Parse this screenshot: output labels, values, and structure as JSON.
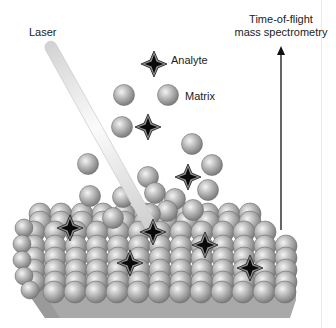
{
  "figure": {
    "labels": {
      "laser": "Laser",
      "analyte": "Analyte",
      "matrix": "Matrix",
      "tof_line1": "Time-of-flight",
      "tof_line2": "mass spectrometry"
    },
    "colors": {
      "sphere_light": "#e6e6e6",
      "sphere_mid": "#b4b4b4",
      "sphere_dark": "#7a7a7a",
      "analyte_halo": "#8f8f8f",
      "analyte_core": "#0a0a0a",
      "laser_light": "#f6f6f6",
      "laser_dark": "#cfcfcf",
      "base": "#a8a8a8",
      "arrow": "#111111"
    },
    "laser": {
      "x1": 48,
      "y1": 42,
      "x2": 154,
      "y2": 232,
      "width": 12
    },
    "arrow": {
      "x": 281,
      "y_top": 46,
      "y_bottom": 230
    },
    "free_matrix": [
      [
        124,
        95
      ],
      [
        168,
        95
      ],
      [
        122,
        127
      ],
      [
        192,
        144
      ],
      [
        88,
        164
      ],
      [
        148,
        177
      ],
      [
        123,
        197
      ],
      [
        155,
        193
      ],
      [
        175,
        199
      ],
      [
        208,
        190
      ],
      [
        212,
        165
      ],
      [
        90,
        196
      ],
      [
        193,
        210
      ],
      [
        167,
        211
      ],
      [
        113,
        218
      ],
      [
        150,
        214
      ]
    ],
    "free_analytes": [
      [
        154,
        64
      ],
      [
        148,
        127
      ],
      [
        188,
        177
      ]
    ],
    "embedded_analytes": [
      [
        70,
        228
      ],
      [
        153,
        232
      ],
      [
        205,
        245
      ],
      [
        130,
        263
      ],
      [
        250,
        268
      ]
    ],
    "legend_matrix_sphere": [
      167,
      95
    ],
    "legend_analyte_icon": [
      154,
      64
    ]
  }
}
